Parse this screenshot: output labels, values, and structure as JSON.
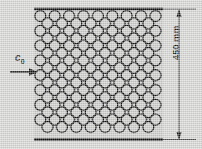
{
  "figure": {
    "type": "technical-engineering-diagram",
    "background_color": "#d4d4d2",
    "line_color": "#141414",
    "field_fill": "#c9c9c7",
    "annotations": {
      "inlet_velocity": {
        "symbol": "c",
        "subscript": "0",
        "icon": "flow-arrow-right-icon",
        "direction": "right"
      },
      "dimension": {
        "value": "450",
        "unit": "mm",
        "text": "450 mm",
        "orientation": "vertical",
        "arrow_style": "double-ended"
      }
    },
    "hole_field": {
      "pattern": "staggered",
      "rows": 17,
      "circle_diameter_px": 11,
      "row_pitch_px": 7.4,
      "col_pitch_px": 14.4,
      "left_px": 34,
      "right_px": 163,
      "top_px": 10,
      "bottom_px": 138
    },
    "boundaries": {
      "top_plate": {
        "x1": 34,
        "x2": 163,
        "y": 9
      },
      "bottom_plate": {
        "x1": 34,
        "x2": 163,
        "y": 139
      }
    }
  }
}
